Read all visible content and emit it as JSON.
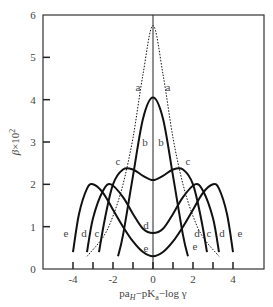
{
  "chart_data": {
    "type": "line",
    "title": "",
    "xlabel": "pa_H − pK_a − log γ",
    "ylabel": "β × 10²",
    "xlim": [
      -5.5,
      5.5
    ],
    "ylim": [
      0,
      6
    ],
    "x_ticks": [
      -4,
      -2,
      0,
      2,
      4
    ],
    "x_minor_ticks": [
      -4,
      -3,
      -2,
      -1,
      0,
      1,
      2,
      3,
      4
    ],
    "y_ticks": [
      0,
      1,
      2,
      3,
      4,
      5,
      6
    ],
    "grid": false,
    "legend": "inline curve labels",
    "series": [
      {
        "name": "a",
        "style": "dotted",
        "x": [
          -3.3,
          -2.5,
          -2.0,
          -1.5,
          -1.0,
          -0.5,
          0,
          0.5,
          1.0,
          1.5,
          2.0,
          2.5,
          3.3
        ],
        "values": [
          0.3,
          0.75,
          1.25,
          2.0,
          3.1,
          4.6,
          5.75,
          4.6,
          3.1,
          2.0,
          1.25,
          0.75,
          0.3
        ]
      },
      {
        "name": "b",
        "style": "solid",
        "x": [
          -1.75,
          -1.5,
          -1.0,
          -0.5,
          0,
          0.5,
          1.0,
          1.5,
          1.75
        ],
        "values": [
          0.3,
          0.8,
          2.2,
          3.55,
          4.05,
          3.55,
          2.2,
          0.8,
          0.3
        ]
      },
      {
        "name": "c",
        "style": "solid",
        "x": [
          -2.7,
          -2.4,
          -2.0,
          -1.5,
          -1.0,
          -0.5,
          0,
          0.5,
          1.0,
          1.5,
          2.0,
          2.4,
          2.7
        ],
        "values": [
          0.4,
          1.2,
          2.0,
          2.35,
          2.35,
          2.2,
          2.1,
          2.2,
          2.35,
          2.35,
          2.0,
          1.2,
          0.4
        ]
      },
      {
        "name": "d",
        "style": "solid",
        "x": [
          -3.3,
          -3.0,
          -2.5,
          -2.1,
          -1.5,
          -1.0,
          -0.5,
          0,
          0.5,
          1.0,
          1.5,
          2.1,
          2.5,
          3.0,
          3.3
        ],
        "values": [
          0.4,
          1.2,
          1.85,
          2.0,
          1.7,
          1.3,
          0.95,
          0.85,
          0.95,
          1.3,
          1.7,
          2.0,
          1.85,
          1.2,
          0.4
        ]
      },
      {
        "name": "e",
        "style": "solid",
        "x": [
          -4.0,
          -3.7,
          -3.3,
          -3.0,
          -2.5,
          -2.0,
          -1.5,
          -1.0,
          -0.5,
          0,
          0.5,
          1.0,
          1.5,
          2.0,
          2.5,
          3.0,
          3.3,
          3.7,
          4.0
        ],
        "values": [
          0.4,
          1.3,
          1.9,
          2.0,
          1.8,
          1.4,
          1.0,
          0.65,
          0.4,
          0.3,
          0.4,
          0.65,
          1.0,
          1.4,
          1.8,
          2.0,
          1.9,
          1.3,
          0.4
        ]
      }
    ],
    "annotations": [
      {
        "text": "a",
        "x": -0.75,
        "y": 4.3
      },
      {
        "text": "a",
        "x": 0.75,
        "y": 4.3
      },
      {
        "text": "b",
        "x": -0.4,
        "y": 3.0
      },
      {
        "text": "b",
        "x": 0.4,
        "y": 3.0
      },
      {
        "text": "c",
        "x": -1.75,
        "y": 2.55
      },
      {
        "text": "c",
        "x": 1.75,
        "y": 2.55
      },
      {
        "text": "d",
        "x": -0.35,
        "y": 1.05
      },
      {
        "text": "d",
        "x": 2.2,
        "y": 0.85
      },
      {
        "text": "e",
        "x": -0.35,
        "y": 0.5
      },
      {
        "text": "e",
        "x": 2.1,
        "y": 0.55
      },
      {
        "text": "c",
        "x": -2.8,
        "y": 0.85
      },
      {
        "text": "d",
        "x": -3.45,
        "y": 0.85
      },
      {
        "text": "e",
        "x": -4.35,
        "y": 0.85
      },
      {
        "text": "c",
        "x": 2.8,
        "y": 0.85
      },
      {
        "text": "d",
        "x": 3.45,
        "y": 0.85
      },
      {
        "text": "e",
        "x": 4.35,
        "y": 0.85
      }
    ]
  },
  "axes": {
    "x_tick_labels": [
      "-4",
      "-2",
      "0",
      "2",
      "4"
    ],
    "y_tick_labels": [
      "0",
      "1",
      "2",
      "3",
      "4",
      "5",
      "6"
    ],
    "xlabel_parts": {
      "p1": "pa",
      "sub1": "H",
      "p2": "−pK",
      "sub2": "a",
      "p3": "−log γ"
    },
    "ylabel_parts": {
      "beta": "β",
      "times": "×10",
      "sup": "2"
    }
  }
}
